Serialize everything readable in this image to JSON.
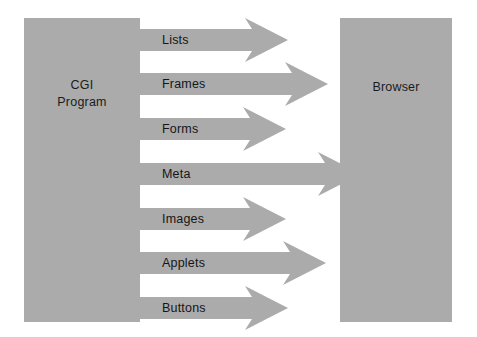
{
  "diagram": {
    "background_color": "#ffffff",
    "shape_color": "#ababab",
    "text_color": "#161616",
    "width": 477,
    "height": 337
  },
  "source_panel": {
    "label": "CGI\nProgram",
    "name": "cgi-program"
  },
  "target_panel": {
    "label": "Browser",
    "name": "browser"
  },
  "arrows": [
    {
      "label": "Lists",
      "length": 116,
      "thickness": 22,
      "head_width": 36,
      "head_height": 44,
      "top": 18
    },
    {
      "label": "Frames",
      "length": 156,
      "thickness": 22,
      "head_width": 36,
      "head_height": 44,
      "top": 62
    },
    {
      "label": "Forms",
      "length": 114,
      "thickness": 22,
      "head_width": 36,
      "head_height": 44,
      "top": 107
    },
    {
      "label": "Meta",
      "length": 189,
      "thickness": 22,
      "head_width": 36,
      "head_height": 44,
      "top": 152
    },
    {
      "label": "Images",
      "length": 114,
      "thickness": 22,
      "head_width": 36,
      "head_height": 44,
      "top": 197
    },
    {
      "label": "Applets",
      "length": 154,
      "thickness": 22,
      "head_width": 36,
      "head_height": 44,
      "top": 241
    },
    {
      "label": "Buttons",
      "length": 116,
      "thickness": 22,
      "head_width": 36,
      "head_height": 44,
      "top": 286
    }
  ]
}
